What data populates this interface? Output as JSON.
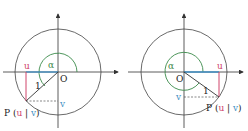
{
  "colors": {
    "axis": "#333333",
    "circle": "#444444",
    "angle_arc": "#3a8a4a",
    "u_color": "#d0456a",
    "v_color": "#3f8fc4",
    "radius": "#333333"
  },
  "diagrams": [
    {
      "alpha_label": "α",
      "origin_label": "O",
      "u_label": "u",
      "v_label": "v",
      "radius_label": "1",
      "point_label_prefix": "P (",
      "point_u": "u",
      "point_sep": " | ",
      "point_v": "v",
      "point_label_suffix": ")",
      "quadrant": "third"
    },
    {
      "alpha_label": "α",
      "origin_label": "O",
      "u_label": "u",
      "v_label": "v",
      "radius_label": "1",
      "point_label_prefix": "P (",
      "point_u": "u",
      "point_sep": " | ",
      "point_v": "v",
      "point_label_suffix": ")",
      "quadrant": "fourth"
    }
  ]
}
